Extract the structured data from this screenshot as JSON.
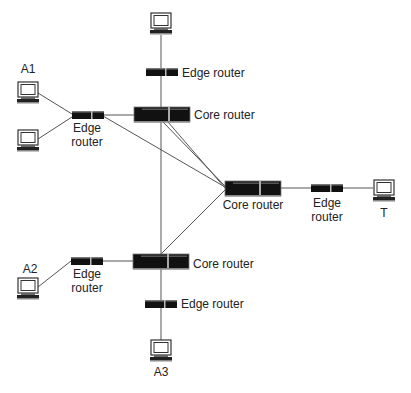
{
  "diagram": {
    "type": "network-topology",
    "colors": {
      "line": "#555555",
      "device": "#111111",
      "background": "#ffffff"
    },
    "nodes": [
      {
        "id": "pc_top",
        "kind": "computer",
        "label": ""
      },
      {
        "id": "edge_top",
        "kind": "edge-router",
        "label": "Edge router"
      },
      {
        "id": "core_top",
        "kind": "core-router",
        "label": "Core router"
      },
      {
        "id": "pc_a1",
        "kind": "computer",
        "label": "A1"
      },
      {
        "id": "pc_left2",
        "kind": "computer",
        "label": ""
      },
      {
        "id": "edge_left_top",
        "kind": "edge-router",
        "label_line1": "Edge",
        "label_line2": "router"
      },
      {
        "id": "core_right",
        "kind": "core-router",
        "label": "Core router"
      },
      {
        "id": "edge_right",
        "kind": "edge-router",
        "label_line1": "Edge",
        "label_line2": "router"
      },
      {
        "id": "pc_t",
        "kind": "computer",
        "label": "T"
      },
      {
        "id": "core_bottom",
        "kind": "core-router",
        "label": "Core router"
      },
      {
        "id": "edge_left_bottom",
        "kind": "edge-router",
        "label_line1": "Edge",
        "label_line2": "router"
      },
      {
        "id": "pc_a2",
        "kind": "computer",
        "label": "A2"
      },
      {
        "id": "edge_bottom",
        "kind": "edge-router",
        "label": "Edge router"
      },
      {
        "id": "pc_a3",
        "kind": "computer",
        "label": "A3"
      }
    ],
    "edges": [
      [
        "pc_top",
        "edge_top"
      ],
      [
        "edge_top",
        "core_top"
      ],
      [
        "pc_a1",
        "edge_left_top"
      ],
      [
        "pc_left2",
        "edge_left_top"
      ],
      [
        "edge_left_top",
        "core_top"
      ],
      [
        "edge_left_top",
        "core_right"
      ],
      [
        "core_top",
        "core_right"
      ],
      [
        "core_top",
        "core_bottom"
      ],
      [
        "core_bottom",
        "core_right"
      ],
      [
        "core_right",
        "edge_right"
      ],
      [
        "edge_right",
        "pc_t"
      ],
      [
        "pc_a2",
        "edge_left_bottom"
      ],
      [
        "edge_left_bottom",
        "core_bottom"
      ],
      [
        "core_bottom",
        "edge_bottom"
      ],
      [
        "edge_bottom",
        "pc_a3"
      ]
    ]
  }
}
